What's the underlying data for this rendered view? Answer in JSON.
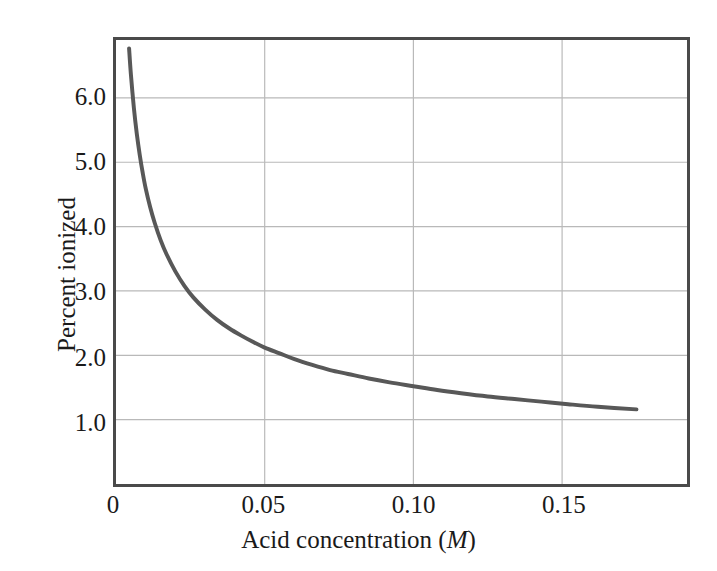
{
  "chart_data": {
    "type": "line",
    "title": "",
    "subtitle": "",
    "xlabel": "Acid concentration (M)",
    "xlabel_text": "Acid concentration (",
    "xlabel_unit": "M",
    "xlabel_tail": ")",
    "ylabel": "Percent ionized",
    "xlim": [
      0,
      0.192
    ],
    "ylim": [
      0.0,
      6.9
    ],
    "grid": true,
    "legend": null,
    "legend_position": "none",
    "line_color": "#585858",
    "grid_color": "#b9b9b9",
    "frame_color": "#4a4a4a",
    "xticks": [
      {
        "value": 0,
        "label": "0"
      },
      {
        "value": 0.05,
        "label": "0.05"
      },
      {
        "value": 0.1,
        "label": "0.10"
      },
      {
        "value": 0.15,
        "label": "0.15"
      }
    ],
    "yticks": [
      {
        "value": 1.0,
        "label": "1.0"
      },
      {
        "value": 2.0,
        "label": "2.0"
      },
      {
        "value": 3.0,
        "label": "3.0"
      },
      {
        "value": 4.0,
        "label": "4.0"
      },
      {
        "value": 5.0,
        "label": "5.0"
      },
      {
        "value": 6.0,
        "label": "6.0"
      }
    ],
    "series": [
      {
        "name": "Percent ionized",
        "x": [
          0.0044,
          0.005,
          0.006,
          0.007,
          0.008,
          0.009,
          0.01,
          0.0115,
          0.013,
          0.015,
          0.017,
          0.02,
          0.023,
          0.026,
          0.03,
          0.034,
          0.038,
          0.042,
          0.046,
          0.05,
          0.055,
          0.06,
          0.066,
          0.072,
          0.078,
          0.085,
          0.092,
          0.1,
          0.108,
          0.116,
          0.125,
          0.134,
          0.143,
          0.152,
          0.162,
          0.175
        ],
        "y": [
          6.77,
          6.37,
          5.85,
          5.44,
          5.11,
          4.83,
          4.59,
          4.3,
          4.06,
          3.79,
          3.57,
          3.3,
          3.08,
          2.9,
          2.71,
          2.55,
          2.42,
          2.31,
          2.21,
          2.12,
          2.03,
          1.94,
          1.85,
          1.77,
          1.71,
          1.64,
          1.58,
          1.52,
          1.46,
          1.41,
          1.36,
          1.32,
          1.28,
          1.24,
          1.2,
          1.16
        ]
      }
    ]
  },
  "axes": {
    "y_title": "Percent ionized"
  }
}
